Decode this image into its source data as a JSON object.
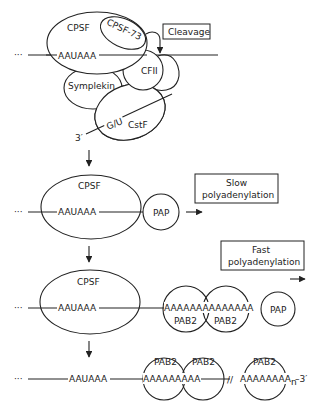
{
  "diagram": {
    "stage1": {
      "left_dots": "···",
      "signal": "AAUAAA",
      "complexes": {
        "cpsf": "CPSF",
        "cpsf73": "CPSF-73",
        "cfii": "CFII",
        "symplekin": "Symplekin",
        "cstf": "CstF",
        "gu": "G/U"
      },
      "three_prime": "3′",
      "callout": "Cleavage"
    },
    "stage2": {
      "left_dots": "···",
      "signal": "AAUAAA",
      "cpsf": "CPSF",
      "pap": "PAP",
      "callout_line1": "Slow",
      "callout_line2": "polyadenylation"
    },
    "stage3": {
      "left_dots": "···",
      "signal": "AAUAAA",
      "cpsf": "CPSF",
      "polyA": "AAAAAAAAAAAAAA",
      "pab2_a": "PAB2",
      "pab2_b": "PAB2",
      "pap": "PAP",
      "callout_line1": "Fast",
      "callout_line2": "polyadenylation"
    },
    "stage4": {
      "left_dots": "···",
      "signal": "AAUAAA",
      "polyA_1": "AAAAAAAAA",
      "polyA_2": "AAAAAAAA",
      "subscript": "n",
      "three_prime": "–3′",
      "pab2_a": "PAB2",
      "pab2_b": "PAB2",
      "pab2_c": "PAB2",
      "break_mark": "//"
    }
  }
}
